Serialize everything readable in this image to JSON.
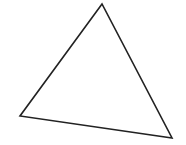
{
  "diagram": {
    "shape": "triangle",
    "background": "#ffffff",
    "stroke_color": "#222222",
    "fill_color": "none",
    "stroke_width": 1.6,
    "vertices": [
      {
        "label": "apex",
        "x": 102,
        "y": 4
      },
      {
        "label": "left",
        "x": 20,
        "y": 116
      },
      {
        "label": "bottom-right",
        "x": 172,
        "y": 138
      }
    ]
  }
}
